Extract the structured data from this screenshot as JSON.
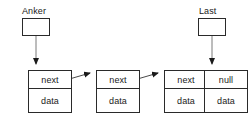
{
  "diagram": {
    "colors": {
      "stroke": "#2a2a2a",
      "text": "#1a1a1a",
      "background": "#ffffff",
      "arrow": "#1a1a1a"
    },
    "pointers": [
      {
        "label": "Anker",
        "box_value": ""
      },
      {
        "label": "Last",
        "box_value": ""
      }
    ],
    "nodes": [
      {
        "next_label": "next",
        "data_label": "data"
      },
      {
        "next_label": "next",
        "data_label": "data"
      },
      {
        "next_label": "next",
        "data_label": "data"
      },
      {
        "next_label": "null",
        "data_label": "data"
      }
    ]
  }
}
